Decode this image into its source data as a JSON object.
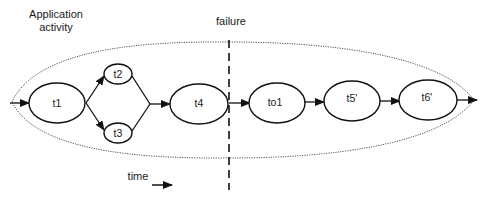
{
  "labels": {
    "application_activity_line1": "Application",
    "application_activity_line2": "activity",
    "failure": "failure",
    "time": "time"
  },
  "nodes": {
    "t1": "t1",
    "t2": "t2",
    "t3": "t3",
    "t4": "t4",
    "to1": "to1",
    "t5p": "t5'",
    "t6p": "t6'"
  },
  "colors": {
    "stroke": "#111111",
    "dotted": "#555555",
    "background": "#ffffff"
  }
}
